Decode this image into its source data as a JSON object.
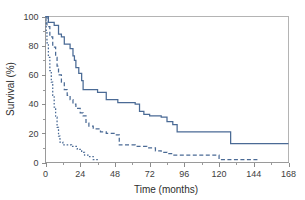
{
  "chart_data": {
    "type": "line",
    "title": "",
    "subtitle": "",
    "xlabel": "Time (months)",
    "ylabel": "Survival (%)",
    "xlim": [
      0,
      168
    ],
    "ylim": [
      0,
      100
    ],
    "xticks": [
      0,
      24,
      48,
      72,
      96,
      120,
      144,
      168
    ],
    "xtick_labels": [
      "0",
      "24",
      "48",
      "72",
      "96",
      "120",
      "144",
      "168"
    ],
    "x_minor_tick_interval": 12,
    "yticks": [
      0,
      20,
      40,
      60,
      80,
      100
    ],
    "ytick_labels": [
      "0",
      "20",
      "40",
      "60",
      "80",
      "100"
    ],
    "y_minor_tick_interval": 10,
    "grid": false,
    "legend_position": "none",
    "style": "kaplan-meier step curves",
    "curve_color": "#4a6a95",
    "axis_color": "#9a9a9a",
    "frame_color": "#b4b4b4",
    "series": [
      {
        "name": "curve-1-solid",
        "line_style": "solid",
        "dasharray": "",
        "color": "#4a6a95",
        "points": [
          [
            0,
            100
          ],
          [
            2,
            100
          ],
          [
            2,
            96
          ],
          [
            6,
            96
          ],
          [
            6,
            94
          ],
          [
            9,
            94
          ],
          [
            9,
            88
          ],
          [
            11,
            88
          ],
          [
            11,
            86
          ],
          [
            13,
            86
          ],
          [
            13,
            81
          ],
          [
            17,
            81
          ],
          [
            17,
            78
          ],
          [
            19,
            78
          ],
          [
            19,
            73
          ],
          [
            20,
            73
          ],
          [
            20,
            70
          ],
          [
            21,
            70
          ],
          [
            21,
            65
          ],
          [
            23,
            65
          ],
          [
            23,
            61
          ],
          [
            25,
            61
          ],
          [
            25,
            56
          ],
          [
            26,
            56
          ],
          [
            26,
            50
          ],
          [
            36,
            50
          ],
          [
            36,
            48
          ],
          [
            42,
            48
          ],
          [
            42,
            43
          ],
          [
            50,
            43
          ],
          [
            50,
            41
          ],
          [
            62,
            41
          ],
          [
            62,
            40
          ],
          [
            65,
            40
          ],
          [
            65,
            35
          ],
          [
            68,
            35
          ],
          [
            68,
            33
          ],
          [
            72,
            33
          ],
          [
            72,
            32
          ],
          [
            80,
            32
          ],
          [
            80,
            31
          ],
          [
            84,
            31
          ],
          [
            84,
            28
          ],
          [
            88,
            28
          ],
          [
            88,
            26
          ],
          [
            91,
            26
          ],
          [
            91,
            21
          ],
          [
            128,
            21
          ],
          [
            128,
            13
          ],
          [
            168,
            13
          ]
        ]
      },
      {
        "name": "curve-2-dashed",
        "line_style": "dashed",
        "dasharray": "4,2.5",
        "color": "#4a6a95",
        "points": [
          [
            0,
            100
          ],
          [
            1,
            100
          ],
          [
            1,
            93
          ],
          [
            3,
            93
          ],
          [
            3,
            86
          ],
          [
            5,
            86
          ],
          [
            5,
            79
          ],
          [
            7,
            79
          ],
          [
            7,
            72
          ],
          [
            8,
            72
          ],
          [
            8,
            66
          ],
          [
            9,
            66
          ],
          [
            9,
            60
          ],
          [
            11,
            60
          ],
          [
            11,
            55
          ],
          [
            13,
            55
          ],
          [
            13,
            50
          ],
          [
            15,
            50
          ],
          [
            15,
            46
          ],
          [
            17,
            46
          ],
          [
            17,
            43
          ],
          [
            19,
            43
          ],
          [
            19,
            40
          ],
          [
            21,
            40
          ],
          [
            21,
            37
          ],
          [
            24,
            37
          ],
          [
            24,
            34
          ],
          [
            26,
            34
          ],
          [
            26,
            32
          ],
          [
            28,
            32
          ],
          [
            28,
            27
          ],
          [
            30,
            27
          ],
          [
            30,
            25
          ],
          [
            33,
            25
          ],
          [
            33,
            23
          ],
          [
            38,
            23
          ],
          [
            38,
            21
          ],
          [
            42,
            21
          ],
          [
            42,
            20
          ],
          [
            48,
            20
          ],
          [
            48,
            19
          ],
          [
            51,
            19
          ],
          [
            51,
            12
          ],
          [
            62,
            12
          ],
          [
            62,
            11
          ],
          [
            70,
            11
          ],
          [
            70,
            10
          ],
          [
            76,
            10
          ],
          [
            76,
            8
          ],
          [
            80,
            8
          ],
          [
            80,
            7
          ],
          [
            84,
            7
          ],
          [
            84,
            6
          ],
          [
            88,
            6
          ],
          [
            88,
            5
          ],
          [
            120,
            5
          ],
          [
            120,
            2
          ],
          [
            147,
            2
          ]
        ]
      },
      {
        "name": "curve-3-dotted",
        "line_style": "dotted",
        "dasharray": "1.6,1.8",
        "color": "#4a6a95",
        "points": [
          [
            0,
            100
          ],
          [
            0.5,
            100
          ],
          [
            0.5,
            90
          ],
          [
            1,
            90
          ],
          [
            1,
            82
          ],
          [
            2,
            82
          ],
          [
            2,
            72
          ],
          [
            3,
            72
          ],
          [
            3,
            63
          ],
          [
            4,
            63
          ],
          [
            4,
            55
          ],
          [
            5,
            55
          ],
          [
            5,
            46
          ],
          [
            6,
            46
          ],
          [
            6,
            38
          ],
          [
            7,
            38
          ],
          [
            7,
            31
          ],
          [
            8,
            31
          ],
          [
            8,
            24
          ],
          [
            9,
            24
          ],
          [
            9,
            18
          ],
          [
            10,
            18
          ],
          [
            10,
            14
          ],
          [
            12,
            14
          ],
          [
            12,
            12
          ],
          [
            18,
            12
          ],
          [
            18,
            11
          ],
          [
            22,
            11
          ],
          [
            22,
            9
          ],
          [
            25,
            9
          ],
          [
            25,
            7
          ],
          [
            27,
            7
          ],
          [
            27,
            5
          ],
          [
            30,
            5
          ],
          [
            30,
            4
          ],
          [
            33,
            4
          ],
          [
            33,
            2
          ],
          [
            37,
            2
          ]
        ]
      }
    ]
  }
}
